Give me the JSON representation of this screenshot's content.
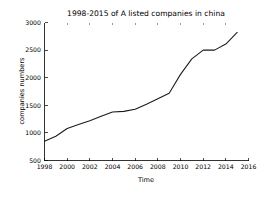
{
  "chart_data": {
    "type": "line",
    "title": "1998-2015 of A listed companies in china",
    "xlabel": "Time",
    "ylabel": "companies numbers",
    "xlim": [
      1998,
      2016
    ],
    "ylim": [
      500,
      3000
    ],
    "xticks": [
      1998,
      2000,
      2002,
      2004,
      2006,
      2008,
      2010,
      2012,
      2014,
      2016
    ],
    "xticklabels": [
      "1998",
      "2000",
      "2002",
      "2004",
      "2006",
      "2008",
      "2010",
      "2012",
      "2014",
      "2016"
    ],
    "yticks": [
      500,
      1000,
      1500,
      2000,
      2500,
      3000
    ],
    "yticklabels": [
      "500",
      "1000",
      "1500",
      "2000",
      "2500",
      "3000"
    ],
    "grid": false,
    "legend": null,
    "line_color": "#1a1a1a",
    "x": [
      1998,
      1999,
      2000,
      2001,
      2002,
      2003,
      2004,
      2005,
      2006,
      2007,
      2008,
      2009,
      2010,
      2011,
      2012,
      2013,
      2014,
      2015
    ],
    "values": [
      850,
      940,
      1080,
      1150,
      1220,
      1300,
      1380,
      1390,
      1430,
      1520,
      1620,
      1720,
      2060,
      2340,
      2500,
      2500,
      2610,
      2820
    ],
    "series": [
      {
        "name": "companies numbers",
        "values": [
          850,
          940,
          1080,
          1150,
          1220,
          1300,
          1380,
          1390,
          1430,
          1520,
          1620,
          1720,
          2060,
          2340,
          2500,
          2500,
          2610,
          2820
        ]
      }
    ]
  },
  "figure": {
    "background_color": "#ffffff",
    "axis_color": "#000000"
  }
}
